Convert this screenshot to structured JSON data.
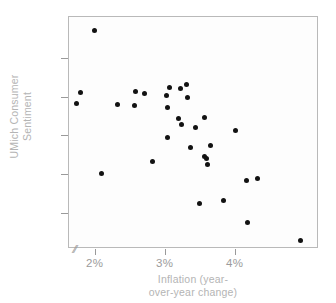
{
  "chart_data": {
    "type": "scatter",
    "title": "",
    "xlabel": "Inflation (year-over-year change)",
    "ylabel": "UMich Consumer Sentiment",
    "xlabel_lines": [
      "Inflation (year-",
      "over-year change)"
    ],
    "ylabel_lines": [
      "UMich Consumer",
      "Sentiment"
    ],
    "xticks": [
      "2%",
      "3%",
      "4%"
    ],
    "xtick_values": [
      2,
      3,
      4
    ],
    "yticks": [
      "100",
      "95",
      "90",
      "85",
      "80"
    ],
    "ytick_values": [
      100,
      95,
      90,
      85,
      80
    ],
    "xlim": [
      1.62,
      5.19
    ],
    "ylim": [
      75.4,
      105.5
    ],
    "grid": false,
    "legend": false,
    "axis_break": "//",
    "axis_break_note": "x-axis origin break mark",
    "marker_color": "#121212",
    "axis_color": "#9a9a9a",
    "label_color": "#b4b4b4",
    "tick_label_color": "#9b9b9b",
    "frame_color": "#b9b9b9",
    "points": [
      {
        "x": 1.72,
        "y": 94.3
      },
      {
        "x": 1.78,
        "y": 95.7
      },
      {
        "x": 1.99,
        "y": 103.7
      },
      {
        "x": 2.09,
        "y": 85.2
      },
      {
        "x": 2.31,
        "y": 94.1
      },
      {
        "x": 2.56,
        "y": 94.0
      },
      {
        "x": 2.57,
        "y": 95.8
      },
      {
        "x": 2.7,
        "y": 95.6
      },
      {
        "x": 2.81,
        "y": 86.7
      },
      {
        "x": 3.01,
        "y": 95.3
      },
      {
        "x": 3.02,
        "y": 93.8
      },
      {
        "x": 3.03,
        "y": 89.9
      },
      {
        "x": 3.06,
        "y": 96.4
      },
      {
        "x": 3.19,
        "y": 92.3
      },
      {
        "x": 3.21,
        "y": 96.2
      },
      {
        "x": 3.22,
        "y": 91.5
      },
      {
        "x": 3.3,
        "y": 96.7
      },
      {
        "x": 3.31,
        "y": 95.1
      },
      {
        "x": 3.35,
        "y": 88.6
      },
      {
        "x": 3.43,
        "y": 91.2
      },
      {
        "x": 3.49,
        "y": 81.3
      },
      {
        "x": 3.55,
        "y": 92.5
      },
      {
        "x": 3.56,
        "y": 87.4
      },
      {
        "x": 3.58,
        "y": 87.1
      },
      {
        "x": 3.6,
        "y": 86.4
      },
      {
        "x": 3.64,
        "y": 88.8
      },
      {
        "x": 3.82,
        "y": 81.7
      },
      {
        "x": 4.0,
        "y": 90.8
      },
      {
        "x": 4.15,
        "y": 84.3
      },
      {
        "x": 4.17,
        "y": 78.8
      },
      {
        "x": 4.31,
        "y": 84.5
      },
      {
        "x": 4.93,
        "y": 76.5
      }
    ]
  }
}
